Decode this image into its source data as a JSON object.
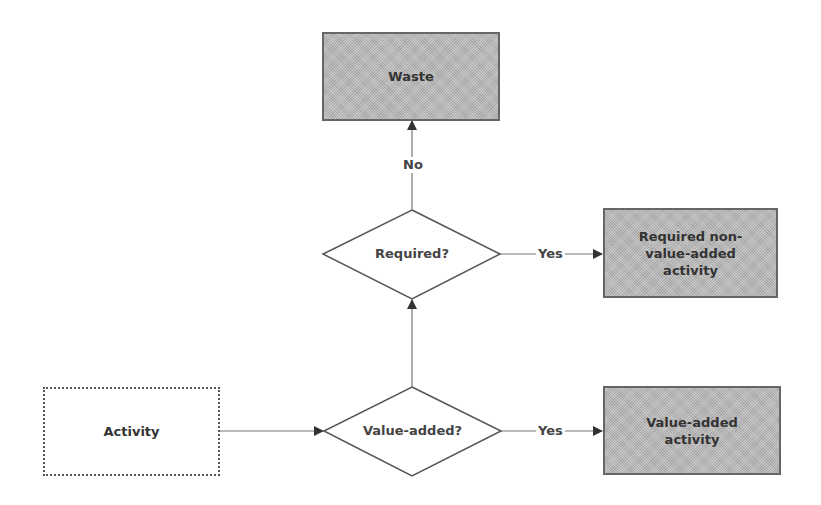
{
  "diagram": {
    "type": "flowchart",
    "nodes": {
      "waste": {
        "label": "Waste",
        "shape": "rectangle",
        "fill": "#b8b8b8"
      },
      "required": {
        "label": "Required?",
        "shape": "diamond",
        "fill": "#ffffff"
      },
      "required_nva": {
        "label_lines": [
          "Required non-",
          "value-added",
          "activity"
        ],
        "shape": "rectangle",
        "fill": "#b8b8b8"
      },
      "activity": {
        "label": "Activity",
        "shape": "rectangle",
        "fill": "#ffffff"
      },
      "value_added": {
        "label": "Value-added?",
        "shape": "diamond",
        "fill": "#ffffff"
      },
      "value_added_activity": {
        "label_lines": [
          "Value-added",
          "activity"
        ],
        "shape": "rectangle",
        "fill": "#b8b8b8"
      }
    },
    "edges": [
      {
        "from": "activity",
        "to": "value_added",
        "label": ""
      },
      {
        "from": "value_added",
        "to": "value_added_activity",
        "label": "Yes"
      },
      {
        "from": "value_added",
        "to": "required",
        "label": ""
      },
      {
        "from": "required",
        "to": "required_nva",
        "label": "Yes"
      },
      {
        "from": "required",
        "to": "waste",
        "label": "No"
      }
    ],
    "edge_labels": {
      "yes_required": "Yes",
      "yes_value_added": "Yes",
      "no_required": "No"
    },
    "colors": {
      "line": "#555555",
      "shaded_fill": "#b8b8b8",
      "text": "#333333"
    }
  }
}
